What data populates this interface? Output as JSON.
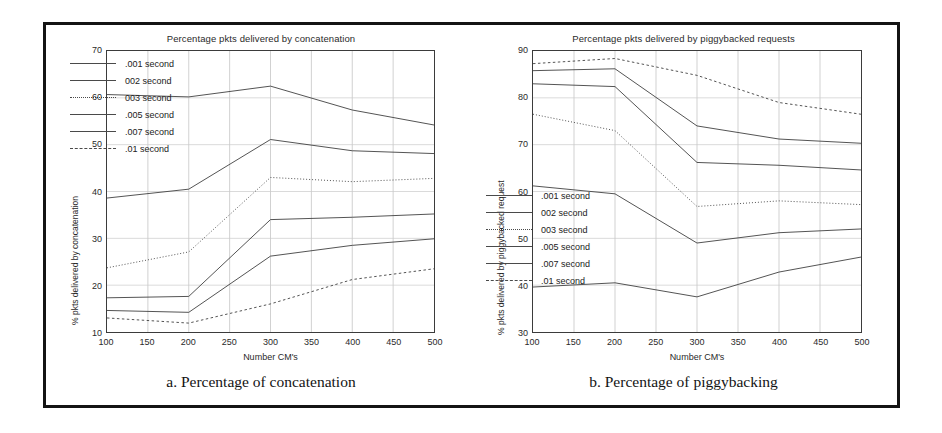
{
  "figure": {
    "panels": [
      {
        "id": "a",
        "caption": "a. Percentage of concatenation"
      },
      {
        "id": "b",
        "caption": "b. Percentage of piggybacking"
      }
    ]
  },
  "legend_labels": [
    ".001 second",
    "002 second",
    "003 second",
    ".005 second",
    ".007 second",
    ".01 second"
  ],
  "chart_data": [
    {
      "type": "line",
      "panel": "a",
      "title": "Percentage pkts delivered by concatenation",
      "xlabel": "Number CM's",
      "ylabel": "% pkts delivered by concatenation",
      "x": [
        100,
        150,
        200,
        250,
        300,
        350,
        400,
        450,
        500
      ],
      "xticks": [
        "100",
        "150",
        "200",
        "250",
        "300",
        "350",
        "400",
        "450",
        "500"
      ],
      "yticks": [
        "10",
        "20",
        "30",
        "40",
        "50",
        "60",
        "70"
      ],
      "xlim": [
        100,
        500
      ],
      "ylim": [
        10,
        70
      ],
      "grid": true,
      "legend_position": "upper-left-inside",
      "data_x": [
        100,
        200,
        300,
        400,
        500
      ],
      "series": [
        {
          "name": ".001 second",
          "values": [
            60.7,
            60.2,
            62.5,
            57.4,
            54.2
          ],
          "style": "solid"
        },
        {
          "name": "002 second",
          "values": [
            38.6,
            40.5,
            51.1,
            48.7,
            48.1
          ],
          "style": "solid"
        },
        {
          "name": "003 second",
          "values": [
            23.7,
            27.1,
            43.0,
            42.1,
            42.8
          ],
          "style": "dotted"
        },
        {
          "name": ".005 second",
          "values": [
            17.3,
            17.6,
            34.0,
            34.5,
            35.2
          ],
          "style": "solid"
        },
        {
          "name": ".007 second",
          "values": [
            14.6,
            14.2,
            26.2,
            28.5,
            29.9
          ],
          "style": "solid"
        },
        {
          "name": ".01 second",
          "values": [
            13.0,
            11.9,
            16.0,
            21.2,
            23.5
          ],
          "style": "dashed"
        }
      ]
    },
    {
      "type": "line",
      "panel": "b",
      "title": "Percentage pkts delivered by piggybacked requests",
      "xlabel": "Number CM's",
      "ylabel": "% pkts delivered by piggybacked request",
      "x": [
        100,
        150,
        200,
        250,
        300,
        350,
        400,
        450,
        500
      ],
      "xticks": [
        "100",
        "150",
        "200",
        "250",
        "300",
        "350",
        "400",
        "450",
        "500"
      ],
      "yticks": [
        "30",
        "40",
        "50",
        "60",
        "70",
        "80",
        "90"
      ],
      "xlim": [
        100,
        500
      ],
      "ylim": [
        30,
        90
      ],
      "grid": true,
      "legend_position": "lower-left-inside",
      "data_x": [
        100,
        200,
        300,
        400,
        500
      ],
      "series": [
        {
          "name": ".001 second",
          "values": [
            39.6,
            40.5,
            37.5,
            42.8,
            46.0
          ],
          "style": "solid"
        },
        {
          "name": "002 second",
          "values": [
            61.2,
            59.5,
            49.0,
            51.2,
            52.0
          ],
          "style": "solid"
        },
        {
          "name": "003 second",
          "values": [
            76.5,
            73.0,
            56.8,
            58.0,
            57.2
          ],
          "style": "dotted"
        },
        {
          "name": ".005 second",
          "values": [
            83.0,
            82.4,
            66.2,
            65.6,
            64.6
          ],
          "style": "solid"
        },
        {
          "name": ".007 second",
          "values": [
            85.8,
            86.2,
            74.0,
            71.2,
            70.3
          ],
          "style": "solid"
        },
        {
          "name": ".01 second",
          "values": [
            87.3,
            88.4,
            84.8,
            79.0,
            76.5
          ],
          "style": "dashed"
        }
      ]
    }
  ]
}
